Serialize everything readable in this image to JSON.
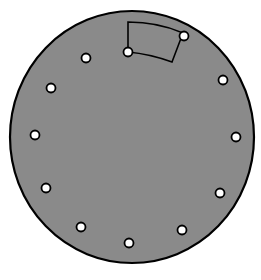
{
  "diagram": {
    "type": "perforated-disc",
    "colors": {
      "background": "#ffffff",
      "disc_fill": "#8a8a8a",
      "outline": "#000000",
      "hole_fill": "#ffffff"
    },
    "disc": {
      "cx": 132,
      "cy": 137,
      "rx": 122,
      "ry": 126
    },
    "hole_radius": 4.5,
    "holes": [
      {
        "id": "hole-1",
        "x": 128,
        "y": 52
      },
      {
        "id": "hole-2",
        "x": 184,
        "y": 36
      },
      {
        "id": "hole-3",
        "x": 223,
        "y": 80
      },
      {
        "id": "hole-4",
        "x": 236,
        "y": 137
      },
      {
        "id": "hole-5",
        "x": 220,
        "y": 193
      },
      {
        "id": "hole-6",
        "x": 182,
        "y": 230
      },
      {
        "id": "hole-7",
        "x": 129,
        "y": 243
      },
      {
        "id": "hole-8",
        "x": 81,
        "y": 227
      },
      {
        "id": "hole-9",
        "x": 46,
        "y": 188
      },
      {
        "id": "hole-10",
        "x": 35,
        "y": 135
      },
      {
        "id": "hole-11",
        "x": 51,
        "y": 88
      },
      {
        "id": "hole-12",
        "x": 86,
        "y": 58
      }
    ],
    "sector": {
      "label": "highlighted-sector",
      "path": "M128,52 L128,22 Q158,22 183,33 L172,62 Q150,54 128,52 Z"
    }
  }
}
